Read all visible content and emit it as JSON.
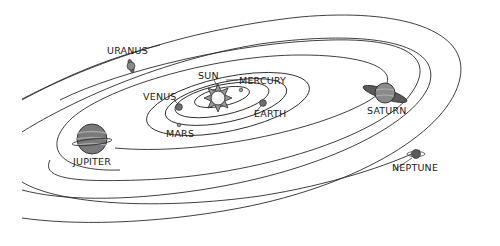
{
  "diagram": {
    "type": "orbital diagram",
    "colors": {
      "background": "#ffffff",
      "orbit_line": "#2a2a2a",
      "label_text": "#1a1a1a",
      "planet_fill": "#7a7a7a",
      "sun_fill": "#f2f2f2"
    },
    "bodies": [
      {
        "name": "SUN",
        "label": "SUN",
        "x": 218,
        "y": 98,
        "label_x": 198,
        "label_y": 71
      },
      {
        "name": "MERCURY",
        "label": "MERCURY",
        "x": 241,
        "y": 90,
        "label_x": 238,
        "label_y": 77
      },
      {
        "name": "VENUS",
        "label": "VENUS",
        "x": 179,
        "y": 107,
        "label_x": 143,
        "label_y": 92
      },
      {
        "name": "EARTH",
        "label": "EARTH",
        "x": 263,
        "y": 103,
        "label_x": 253,
        "label_y": 110
      },
      {
        "name": "MARS",
        "label": "MARS",
        "x": 179,
        "y": 125,
        "label_x": 166,
        "label_y": 130
      },
      {
        "name": "JUPITER",
        "label": "JUPITER",
        "x": 92,
        "y": 139,
        "label_x": 73,
        "label_y": 158
      },
      {
        "name": "SATURN",
        "label": "SATURN",
        "x": 385,
        "y": 94,
        "label_x": 367,
        "label_y": 107
      },
      {
        "name": "URANUS",
        "label": "URANUS",
        "x": 131,
        "y": 66,
        "label_x": 107,
        "label_y": 47
      },
      {
        "name": "NEPTUNE",
        "label": "NEPTUNE",
        "x": 416,
        "y": 154,
        "label_x": 392,
        "label_y": 163
      }
    ]
  }
}
